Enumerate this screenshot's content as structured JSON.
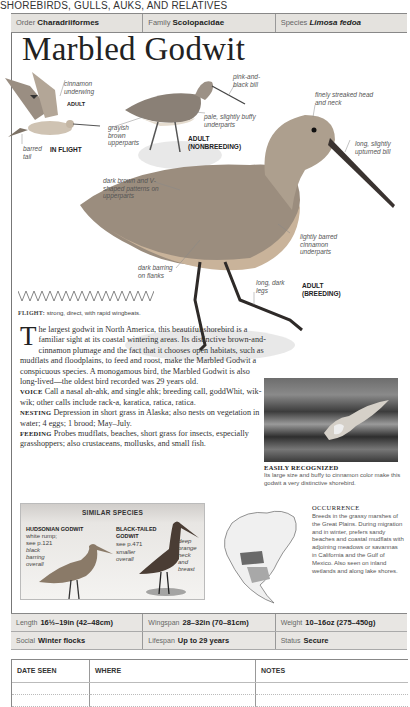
{
  "section": "SHOREBIRDS, GULLS, AUKS, AND RELATIVES",
  "taxonomy": {
    "order_label": "Order",
    "order": "Charadriiformes",
    "family_label": "Family",
    "family": "Scolopacidae",
    "species_label": "Species",
    "species": "Limosa fedoa"
  },
  "title": "Marbled Godwit",
  "illustration_labels": {
    "flight_underwing": "cinnamon underwing",
    "flight_adult": "ADULT",
    "flight_tail": "barred tail",
    "flight_caption": "IN FLIGHT",
    "nb_bill": "pink-and-black bill",
    "nb_upperparts": "grayish brown upperparts",
    "nb_underparts": "pale, slightly buffy underparts",
    "nb_caption_1": "ADULT",
    "nb_caption_2": "(NONBREEDING)",
    "br_head": "finely streaked head and neck",
    "br_bill": "long, slightly upturned bill",
    "br_upperparts": "dark brown and V-shaped patterns on upperparts",
    "br_underparts": "lightly barred cinnamon underparts",
    "br_flanks": "dark barring on flanks",
    "br_legs": "long, dark legs",
    "br_caption_1": "ADULT",
    "br_caption_2": "(BREEDING)"
  },
  "flight": {
    "label": "FLIGHT:",
    "text": "strong, direct, with rapid wingbeats."
  },
  "description": {
    "dropcap": "T",
    "intro": "he largest godwit in North America, this beautiful shorebird is a familiar sight at its coastal wintering areas. Its distinctive brown-and-cinnamon plumage and the fact that it chooses open habitats, such as mudflats and floodplains, to feed and roost, make the Marbled Godwit a conspicuous species. A monogamous bird, the Marbled Godwit is also long-lived—the oldest bird recorded was 29 years old.",
    "voice_label": "VOICE",
    "voice": "Call a nasal ah-ahk, and single ahk; breeding call, goddWhit, wik-wik; other calls include rack-a, karatica, ratica, ratica.",
    "nesting_label": "NESTING",
    "nesting": "Depression in short grass in Alaska; also nests on vegetation in water; 4 eggs; 1 brood; May–July.",
    "feeding_label": "FEEDING",
    "feeding": "Probes mudflats, beaches, short grass for insects, especially grasshoppers; also crustaceans, mollusks, and small fish."
  },
  "photo": {
    "title": "EASILY RECOGNIZED",
    "caption": "Its large size and buffy to cinnamon color make this godwit a very distinctive shorebird."
  },
  "similar_species": {
    "title": "SIMILAR SPECIES",
    "a_name": "HUDSONIAN GODWIT",
    "a_note1": "white rump;",
    "a_note2": "see p.121",
    "a_note3": "black barring overall",
    "b_name1": "BLACK-TAILED",
    "b_name2": "GODWIT",
    "b_note1": "see p.471",
    "b_note2": "smaller overall",
    "b_note3": "deep orange neck and breast"
  },
  "occurrence": {
    "title": "OCCURRENCE",
    "text": "Breeds in the grassy marshes of the Great Plains. During migration and in winter, prefers sandy beaches and coastal mudflats with adjoining meadows or savannas in California and the Gulf of Mexico. Also seen on inland wetlands and along lake shores."
  },
  "stats": {
    "length_label": "Length",
    "length": "16½–19in (42–48cm)",
    "wingspan_label": "Wingspan",
    "wingspan": "28–32in (70–81cm)",
    "weight_label": "Weight",
    "weight": "10–16oz (275–450g)",
    "social_label": "Social",
    "social": "Winter flocks",
    "lifespan_label": "Lifespan",
    "lifespan": "Up to 29 years",
    "status_label": "Status",
    "status": "Secure"
  },
  "log": {
    "col1": "DATE SEEN",
    "col2": "WHERE",
    "col3": "NOTES"
  },
  "colors": {
    "header_bg": "#e4e2de",
    "map_breeding": "#6a6a6a",
    "map_winter": "#a8a8a8"
  }
}
